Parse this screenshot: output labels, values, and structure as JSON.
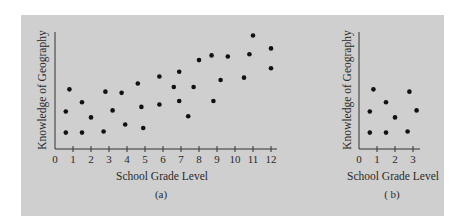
{
  "panel": {
    "background": "#cfcfcf",
    "dot_color": "#111111",
    "axis_color": "#333333"
  },
  "chart_data": [
    {
      "type": "scatter",
      "panel_label": "(a)",
      "title": "",
      "xlabel": "School Grade Level",
      "ylabel": "Knowledge of Geography",
      "xticks": [
        "0",
        "1",
        "2",
        "3",
        "4",
        "5",
        "6",
        "7",
        "8",
        "9",
        "10",
        "11",
        "12"
      ],
      "xlim": [
        0,
        12.3
      ],
      "ylim": [
        0,
        10
      ],
      "yticks": [],
      "grid": false,
      "legend": null,
      "points": [
        {
          "x": 0.6,
          "y": 1.4
        },
        {
          "x": 0.8,
          "y": 5.1
        },
        {
          "x": 0.6,
          "y": 3.2
        },
        {
          "x": 1.5,
          "y": 4.0
        },
        {
          "x": 1.5,
          "y": 1.4
        },
        {
          "x": 2.0,
          "y": 2.7
        },
        {
          "x": 2.7,
          "y": 1.5
        },
        {
          "x": 2.8,
          "y": 4.9
        },
        {
          "x": 3.2,
          "y": 3.3
        },
        {
          "x": 3.7,
          "y": 4.8
        },
        {
          "x": 3.9,
          "y": 2.1
        },
        {
          "x": 4.6,
          "y": 5.6
        },
        {
          "x": 4.8,
          "y": 3.6
        },
        {
          "x": 4.9,
          "y": 1.8
        },
        {
          "x": 5.8,
          "y": 6.2
        },
        {
          "x": 5.8,
          "y": 3.8
        },
        {
          "x": 6.6,
          "y": 5.3
        },
        {
          "x": 6.9,
          "y": 6.6
        },
        {
          "x": 6.9,
          "y": 4.1
        },
        {
          "x": 7.4,
          "y": 2.8
        },
        {
          "x": 7.7,
          "y": 5.3
        },
        {
          "x": 8.0,
          "y": 7.6
        },
        {
          "x": 8.7,
          "y": 8.0
        },
        {
          "x": 8.8,
          "y": 4.1
        },
        {
          "x": 9.2,
          "y": 5.9
        },
        {
          "x": 9.6,
          "y": 7.9
        },
        {
          "x": 10.5,
          "y": 6.1
        },
        {
          "x": 10.8,
          "y": 8.1
        },
        {
          "x": 11.0,
          "y": 9.7
        },
        {
          "x": 12.0,
          "y": 8.6
        },
        {
          "x": 12.0,
          "y": 6.9
        }
      ]
    },
    {
      "type": "scatter",
      "panel_label": "( b)",
      "title": "",
      "xlabel": "School Grade Level",
      "ylabel": "Knowledge of Geography",
      "xticks": [
        "0",
        "1",
        "2",
        "3"
      ],
      "xlim": [
        0,
        3.4
      ],
      "ylim": [
        0,
        10
      ],
      "yticks": [],
      "grid": false,
      "legend": null,
      "points": [
        {
          "x": 0.6,
          "y": 1.4
        },
        {
          "x": 0.8,
          "y": 5.1
        },
        {
          "x": 0.6,
          "y": 3.2
        },
        {
          "x": 1.5,
          "y": 4.0
        },
        {
          "x": 1.5,
          "y": 1.4
        },
        {
          "x": 2.0,
          "y": 2.7
        },
        {
          "x": 2.7,
          "y": 1.5
        },
        {
          "x": 2.8,
          "y": 4.9
        },
        {
          "x": 3.2,
          "y": 3.3
        }
      ]
    }
  ]
}
